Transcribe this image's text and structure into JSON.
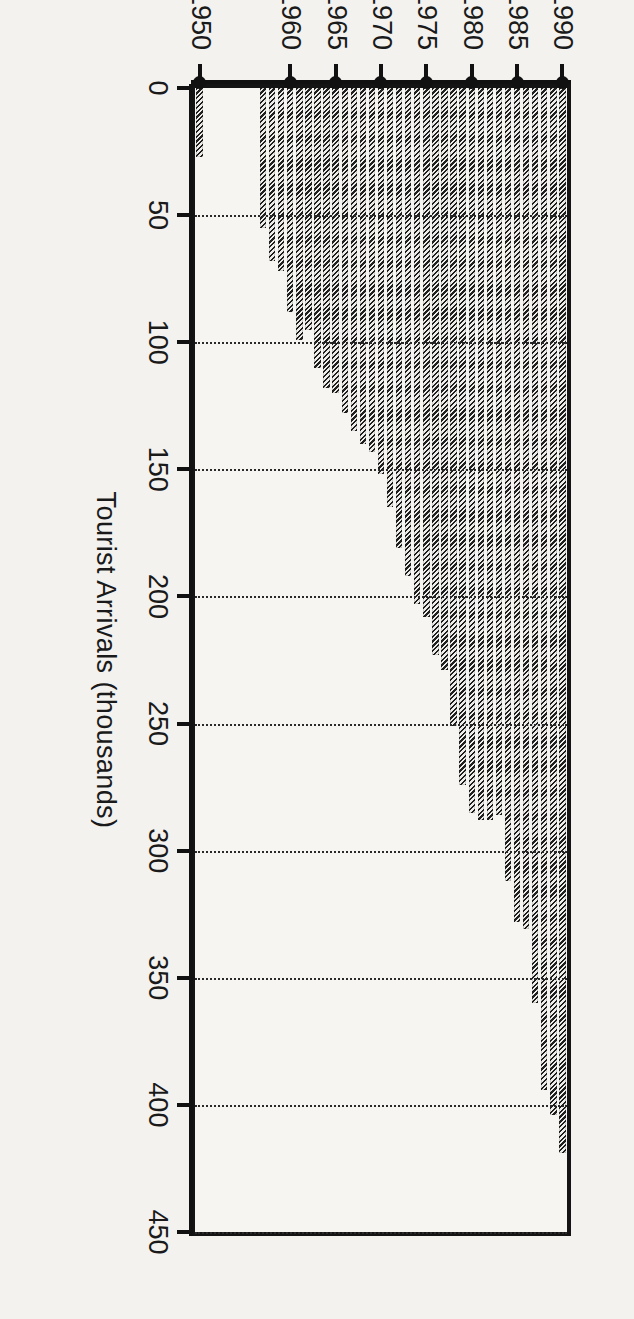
{
  "chart_data": {
    "type": "bar",
    "orientation": "horizontal-rotated",
    "title": "",
    "xlabel": "",
    "ylabel": "Tourist Arrivals (thousands)",
    "value_axis_label": "Tourist Arrivals (thousands)",
    "value_ticks": [
      0,
      50,
      100,
      150,
      200,
      250,
      300,
      350,
      400,
      450
    ],
    "ylim": [
      0,
      450
    ],
    "grid": true,
    "grid_style": "dotted",
    "legend": null,
    "category_axis_ticks": [
      "1950",
      "1960",
      "1965",
      "1970",
      "1975",
      "1980",
      "1985",
      "1990"
    ],
    "categories": [
      "1950",
      "1957",
      "1958",
      "1959",
      "1960",
      "1961",
      "1962",
      "1963",
      "1964",
      "1965",
      "1966",
      "1967",
      "1968",
      "1969",
      "1970",
      "1971",
      "1972",
      "1973",
      "1974",
      "1975",
      "1976",
      "1977",
      "1978",
      "1979",
      "1980",
      "1981",
      "1982",
      "1983",
      "1984",
      "1985",
      "1986",
      "1987",
      "1988",
      "1989",
      "1990"
    ],
    "values": [
      27,
      55,
      68,
      72,
      88,
      99,
      95,
      110,
      118,
      120,
      128,
      135,
      140,
      143,
      152,
      165,
      181,
      192,
      203,
      208,
      223,
      229,
      251,
      274,
      285,
      288,
      288,
      286,
      312,
      328,
      331,
      360,
      394,
      404,
      419
    ],
    "bar_color": "#555555",
    "bar_pattern": "diagonal-hatch",
    "background_color": "#f3f2ef",
    "axis_color": "#111111"
  },
  "axes": {
    "value_axis_title": "Tourist Arrivals (thousands)",
    "tick_labels": {
      "v0": "0",
      "v50": "50",
      "v100": "100",
      "v150": "150",
      "v200": "200",
      "v250": "250",
      "v300": "300",
      "v350": "350",
      "v400": "400",
      "v450": "450"
    },
    "year_labels": {
      "y1950": "1950",
      "y1960": "1960",
      "y1965": "1965",
      "y1970": "1970",
      "y1975": "1975",
      "y1980": "1980",
      "y1985": "1985",
      "y1990": "1990"
    }
  }
}
